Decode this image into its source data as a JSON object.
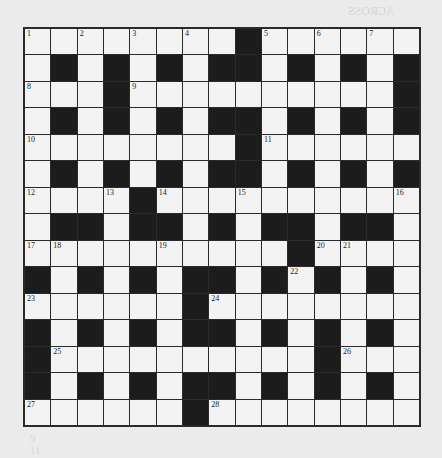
{
  "puzzle": {
    "rows": 15,
    "cols": 15,
    "grid": [
      "........#......",
      ".#.#.#.##.#.#.#",
      "...#..........#",
      ".#.#.#.##.#.#.#",
      "........#......",
      ".#.#.#.##.#.#.#",
      "....#..........",
      ".##.##.#.##.##.",
      "..........#....",
      "#.#.#.##.#.#.#.",
      "......#........",
      "#.#.#.##.#.#.#.",
      "#..........#...",
      "#.#.#.##.#.#.#.",
      "......#........"
    ],
    "numbers": [
      {
        "r": 0,
        "c": 0,
        "n": "1"
      },
      {
        "r": 0,
        "c": 2,
        "n": "2"
      },
      {
        "r": 0,
        "c": 4,
        "n": "3"
      },
      {
        "r": 0,
        "c": 6,
        "n": "4"
      },
      {
        "r": 0,
        "c": 9,
        "n": "5"
      },
      {
        "r": 0,
        "c": 11,
        "n": "6"
      },
      {
        "r": 0,
        "c": 13,
        "n": "7"
      },
      {
        "r": 2,
        "c": 0,
        "n": "8"
      },
      {
        "r": 2,
        "c": 4,
        "n": "9"
      },
      {
        "r": 4,
        "c": 0,
        "n": "10"
      },
      {
        "r": 4,
        "c": 9,
        "n": "11"
      },
      {
        "r": 6,
        "c": 0,
        "n": "12"
      },
      {
        "r": 6,
        "c": 3,
        "n": "13"
      },
      {
        "r": 6,
        "c": 5,
        "n": "14"
      },
      {
        "r": 6,
        "c": 8,
        "n": "15"
      },
      {
        "r": 6,
        "c": 14,
        "n": "16"
      },
      {
        "r": 8,
        "c": 0,
        "n": "17"
      },
      {
        "r": 8,
        "c": 1,
        "n": "18"
      },
      {
        "r": 8,
        "c": 5,
        "n": "19"
      },
      {
        "r": 8,
        "c": 11,
        "n": "20"
      },
      {
        "r": 8,
        "c": 12,
        "n": "21"
      },
      {
        "r": 9,
        "c": 10,
        "n": "22"
      },
      {
        "r": 10,
        "c": 0,
        "n": "23"
      },
      {
        "r": 10,
        "c": 7,
        "n": "24"
      },
      {
        "r": 12,
        "c": 1,
        "n": "25"
      },
      {
        "r": 12,
        "c": 12,
        "n": "26"
      },
      {
        "r": 14,
        "c": 0,
        "n": "27"
      },
      {
        "r": 14,
        "c": 7,
        "n": "28"
      }
    ]
  },
  "show_through": {
    "heading_across": "ACROSS",
    "heading_down": "DOWN",
    "bottom_lines": [
      "9",
      "11"
    ]
  },
  "colors": {
    "background": "#ebebeb",
    "white_cell": "#f3f3f3",
    "black_cell": "#1c1c1c",
    "grid_line": "#2a2a2a"
  }
}
